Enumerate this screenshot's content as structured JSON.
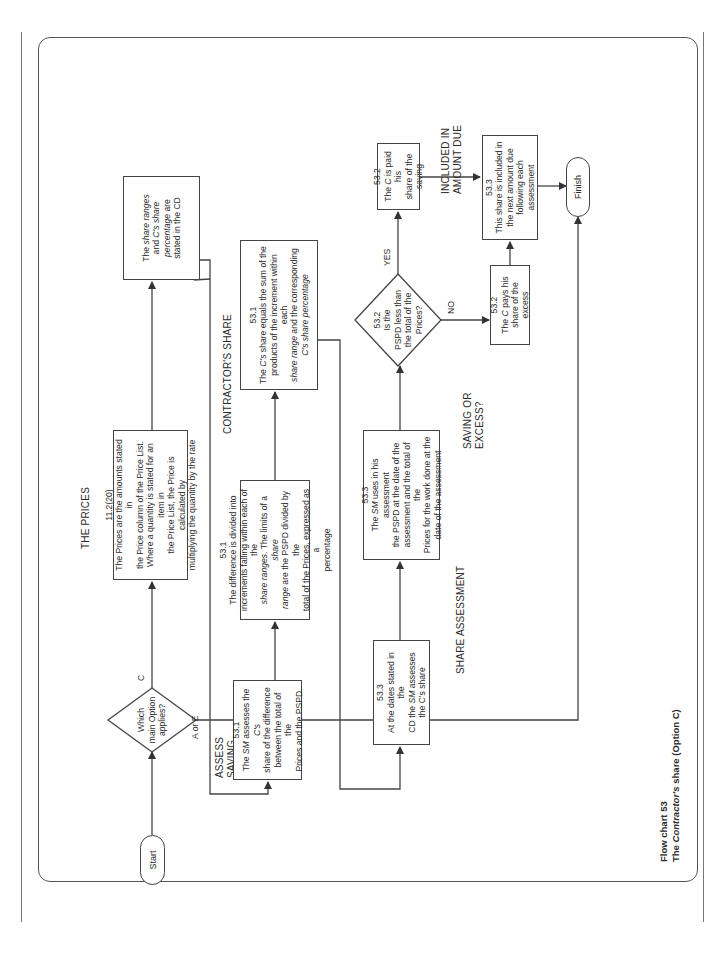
{
  "caption": {
    "number": "Flow chart 53",
    "title_prefix": "The ",
    "title_italic": "Contractor's",
    "title_suffix": " share (Option C)"
  },
  "headings": {
    "the_prices": "THE PRICES",
    "contractors_share": "CONTRACTOR'S SHARE",
    "assess_saving_1": "ASSESS",
    "assess_saving_2": "SAVING",
    "share_assessment": "SHARE ASSESSMENT",
    "saving_or_excess_1": "SAVING OR",
    "saving_or_excess_2": "EXCESS?",
    "included_1": "INCLUDED IN",
    "included_2": "AMOUNT DUE"
  },
  "terminals": {
    "start": "Start",
    "finish": "Finish"
  },
  "decisions": {
    "option": {
      "l1": "Which",
      "l2": "main Option",
      "l3": "applies?",
      "yes_label": "C",
      "no_label": "A or E"
    },
    "pspd": {
      "ref": "53.2",
      "l1": "Is the",
      "l2": "PSPD less than",
      "l3": "the total of the",
      "l4": "Prices?",
      "yes_label": "YES",
      "no_label": "NO"
    }
  },
  "boxes": {
    "prices": {
      "ref": "11.2(20)",
      "l1": "The Prices are the amounts stated in",
      "l2": "the Price column of the Price List.",
      "l3": "Where a quantity is stated for an item in",
      "l4": "the Price List, the Price is calculated by",
      "l5": "multiplying the quantity by the rate"
    },
    "share_ranges": {
      "l1a": "The ",
      "l1i": "share ranges",
      "l2a": "and ",
      "l2i": "C's share",
      "l3i": "percentage",
      "l3b": " are",
      "l4": "stated in the CD"
    },
    "sm_assesses": {
      "ref": "53.1",
      "l1a": "The ",
      "l1i": "SM",
      "l1b": " assesses the ",
      "l1c": "C's",
      "l2": "share of the difference",
      "l3": "between the total of the",
      "l4": "Prices and the PSPD."
    },
    "difference": {
      "ref": "53.1",
      "l1": "The difference is divided into",
      "l2": "increments falling within each of the",
      "l3i": "share ranges",
      "l3b": ". The limits of a ",
      "l3i2": "share",
      "l4i": "range",
      "l4b": " are the PSPD divided by the",
      "l5": "total of the Prices, expressed as a",
      "l6": "percentage"
    },
    "c_share": {
      "ref": "53.1",
      "l1a": "The ",
      "l1i": "C's",
      "l1b": " share equals the sum of the",
      "l2": "products of the increment within each",
      "l3i": "share range",
      "l3b": " and the corresponding",
      "l4i": "C's share percentage"
    },
    "dates": {
      "ref": "53.3",
      "l1": "At the dates stated in the",
      "l2a": "CD the ",
      "l2i": "SM",
      "l2b": " assesses",
      "l3": "the C's share"
    },
    "sm_uses": {
      "ref": "53.3",
      "l1a": "The ",
      "l1i": "SM",
      "l1b": " uses in his assessment",
      "l2": "the PSPD at the date of the",
      "l3": "assessment and the total of the",
      "l4": "Prices for the work done at the",
      "l5": "date of the assessment"
    },
    "paid": {
      "ref": "53.2",
      "l1a": "The ",
      "l1i": "C",
      "l1b": " is paid his",
      "l2": "share of the saving"
    },
    "pays": {
      "ref": "53.2",
      "l1a": "The ",
      "l1i": "C",
      "l1b": " pays his",
      "l2": "share of the excess"
    },
    "included": {
      "ref": "53.3",
      "l1": "This share is included in",
      "l2": "the next amount due",
      "l3": "following each",
      "l4": "assessment"
    }
  }
}
